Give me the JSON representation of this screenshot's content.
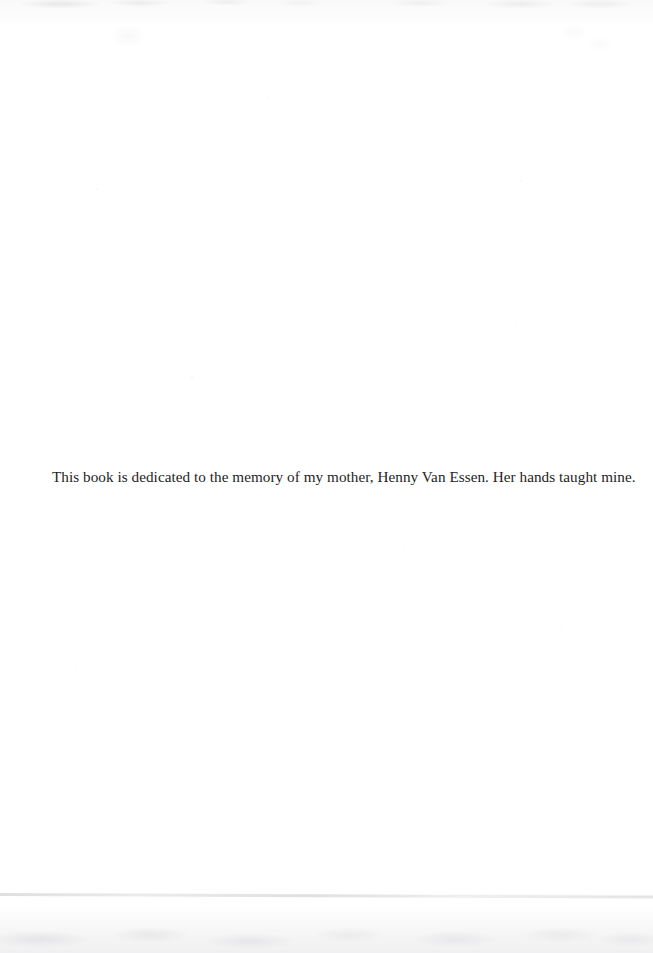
{
  "page": {
    "type": "book-dedication-page",
    "background_color": "#ffffff",
    "text_color": "#242424",
    "dedication": "This book is dedicated to the memory of my mother, Henny Van Essen. Her hands taught mine."
  },
  "artifacts": {
    "top_edge_noise_label": "",
    "scan_seam_label": "",
    "bottom_shadow_label": "",
    "specks": [
      {
        "x": 191,
        "y": 377,
        "size": 2.0,
        "opacity": 0.34
      },
      {
        "x": 96,
        "y": 188,
        "size": 1.6,
        "opacity": 0.18
      },
      {
        "x": 268,
        "y": 97,
        "size": 1.6,
        "opacity": 0.16
      },
      {
        "x": 520,
        "y": 180,
        "size": 1.5,
        "opacity": 0.16
      },
      {
        "x": 516,
        "y": 322,
        "size": 1.5,
        "opacity": 0.14
      },
      {
        "x": 404,
        "y": 548,
        "size": 1.5,
        "opacity": 0.14
      },
      {
        "x": 76,
        "y": 666,
        "size": 1.5,
        "opacity": 0.14
      },
      {
        "x": 560,
        "y": 628,
        "size": 1.5,
        "opacity": 0.12
      },
      {
        "x": 330,
        "y": 732,
        "size": 1.4,
        "opacity": 0.12
      },
      {
        "x": 612,
        "y": 434,
        "size": 1.4,
        "opacity": 0.12
      },
      {
        "x": 148,
        "y": 836,
        "size": 1.4,
        "opacity": 0.12
      },
      {
        "x": 452,
        "y": 812,
        "size": 1.4,
        "opacity": 0.1
      }
    ]
  }
}
